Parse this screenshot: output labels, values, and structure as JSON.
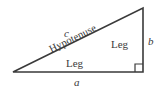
{
  "figure": {
    "background_color": "#ffffff",
    "stroke_color": "#3a3a3a",
    "text_color": "#3a3a3a"
  },
  "geometry": {
    "vertices": {
      "left": [
        13,
        72
      ],
      "bottom_right": [
        143,
        72
      ],
      "top_right": [
        143,
        8
      ]
    },
    "right_angle_marker": {
      "at_vertex": "bottom_right",
      "size": 8
    },
    "hypotenuse_angle_deg": -26.2
  },
  "labels": {
    "side_c": "c",
    "side_a": "a",
    "side_b": "b",
    "hypotenuse": "Hypotenuse",
    "leg_bottom": "Leg",
    "leg_right": "Leg"
  }
}
